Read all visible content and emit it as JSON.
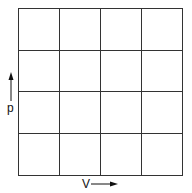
{
  "diagram": {
    "type": "pV grid",
    "grid": {
      "rows": 4,
      "cols": 4
    },
    "y_axis_label": "p",
    "x_axis_label": "V",
    "line_color": "#333333"
  }
}
